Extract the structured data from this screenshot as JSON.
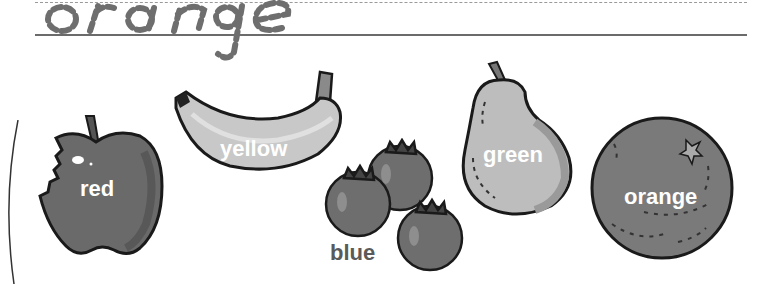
{
  "worksheet": {
    "trace_word": "orange",
    "trace_style": "dashed-cursive",
    "fruits": [
      {
        "name": "apple",
        "label": "red",
        "color": "#6a6a6a"
      },
      {
        "name": "banana",
        "label": "yellow",
        "color": "#c8c8c8"
      },
      {
        "name": "blueberries",
        "label": "blue",
        "color": "#6e6e6e"
      },
      {
        "name": "pear",
        "label": "green",
        "color": "#bdbdbd"
      },
      {
        "name": "orange",
        "label": "orange",
        "color": "#7a7a7a"
      }
    ]
  },
  "colors": {
    "outline": "#1a1a1a",
    "label_text": "#ffffff",
    "label_text_dark": "#5a5a5a",
    "baseline": "#6b6b6b",
    "dashed_guide": "#9a9a9a"
  }
}
